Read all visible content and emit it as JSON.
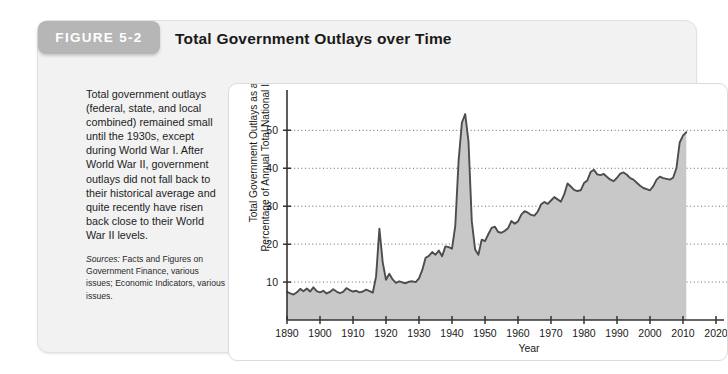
{
  "figure": {
    "tab_label": "FIGURE 5-2",
    "title": "Total Government Outlays over Time",
    "caption": "Total government outlays (federal, state, and local combined) remained small until the 1930s, except during World War I. After World War II, government outlays did not fall back to their historical average and quite recently have risen back close to their World War II levels.",
    "sources_label": "Sources:",
    "sources_text": "Facts and Figures on Government Finance, various issues; Economic Indicators, various issues."
  },
  "colors": {
    "tab_background": "#b6b6b6",
    "card_background": "#f2f2f2",
    "panel_background": "#ffffff",
    "area_fill": "#c8c8c8",
    "line_stroke": "#4d4d4d",
    "axis_stroke": "#333333",
    "grid_stroke": "#555555"
  },
  "chart_data": {
    "type": "area",
    "title": "Total Government Outlays over Time",
    "xlabel": "Year",
    "ylabel": "Total Government Outlays as a Percentage of Annual Total National Income",
    "ylabel_line1": "Total Government Outlays as a",
    "ylabel_line2": "Percentage of Annual Total National Income",
    "xlim": [
      1890,
      2020
    ],
    "ylim": [
      0,
      58
    ],
    "xticks": [
      1890,
      1900,
      1910,
      1920,
      1930,
      1940,
      1950,
      1960,
      1970,
      1980,
      1990,
      2000,
      2010,
      2020
    ],
    "xticklabels": [
      "1890",
      "1900",
      "1910",
      "1920",
      "1930",
      "1940",
      "1950",
      "1960",
      "1970",
      "1980",
      "1990",
      "2000",
      "2010",
      "2020"
    ],
    "yticks": [
      10,
      20,
      30,
      40,
      50
    ],
    "yticklabels": [
      "10",
      "20",
      "30",
      "40",
      "50"
    ],
    "grid": "horizontal-dotted",
    "legend": "none",
    "data_end_year": 2011,
    "x": [
      1890,
      1891,
      1892,
      1893,
      1894,
      1895,
      1896,
      1897,
      1898,
      1899,
      1900,
      1901,
      1902,
      1903,
      1904,
      1905,
      1906,
      1907,
      1908,
      1909,
      1910,
      1911,
      1912,
      1913,
      1914,
      1915,
      1916,
      1917,
      1918,
      1919,
      1920,
      1921,
      1922,
      1923,
      1924,
      1925,
      1926,
      1927,
      1928,
      1929,
      1930,
      1931,
      1932,
      1933,
      1934,
      1935,
      1936,
      1937,
      1938,
      1939,
      1940,
      1941,
      1942,
      1943,
      1944,
      1945,
      1946,
      1947,
      1948,
      1949,
      1950,
      1951,
      1952,
      1953,
      1954,
      1955,
      1956,
      1957,
      1958,
      1959,
      1960,
      1961,
      1962,
      1963,
      1964,
      1965,
      1966,
      1967,
      1968,
      1969,
      1970,
      1971,
      1972,
      1973,
      1974,
      1975,
      1976,
      1977,
      1978,
      1979,
      1980,
      1981,
      1982,
      1983,
      1984,
      1985,
      1986,
      1987,
      1988,
      1989,
      1990,
      1991,
      1992,
      1993,
      1994,
      1995,
      1996,
      1997,
      1998,
      1999,
      2000,
      2001,
      2002,
      2003,
      2004,
      2005,
      2006,
      2007,
      2008,
      2009,
      2010,
      2011
    ],
    "y": [
      7.4,
      7.0,
      6.7,
      7.3,
      8.2,
      7.6,
      8.3,
      7.5,
      8.6,
      7.6,
      7.3,
      7.7,
      7.0,
      7.4,
      8.1,
      7.5,
      7.1,
      7.4,
      8.4,
      7.9,
      7.5,
      7.7,
      7.3,
      7.5,
      8.0,
      7.6,
      7.2,
      11.5,
      24.1,
      15.2,
      10.6,
      12.2,
      10.7,
      9.8,
      10.2,
      9.9,
      9.7,
      10.1,
      10.2,
      10.0,
      11.0,
      13.2,
      16.4,
      16.9,
      17.9,
      17.2,
      18.3,
      16.8,
      19.4,
      19.2,
      18.8,
      24.9,
      42.0,
      52.0,
      54.3,
      47.0,
      26.0,
      18.6,
      17.2,
      21.2,
      20.8,
      22.6,
      24.3,
      24.6,
      23.2,
      23.0,
      23.5,
      24.2,
      26.1,
      25.4,
      26.0,
      27.8,
      28.7,
      28.3,
      27.7,
      27.5,
      28.6,
      30.5,
      31.1,
      30.6,
      31.5,
      32.4,
      31.8,
      31.2,
      33.1,
      36.0,
      35.2,
      34.3,
      34.0,
      34.2,
      36.1,
      36.8,
      39.0,
      39.6,
      38.4,
      38.2,
      38.5,
      37.7,
      37.0,
      36.6,
      37.5,
      38.6,
      38.9,
      38.3,
      37.4,
      37.0,
      36.2,
      35.4,
      34.8,
      34.5,
      34.2,
      35.3,
      37.0,
      37.8,
      37.4,
      37.2,
      37.0,
      37.5,
      40.0,
      46.8,
      48.6,
      49.5
    ]
  }
}
